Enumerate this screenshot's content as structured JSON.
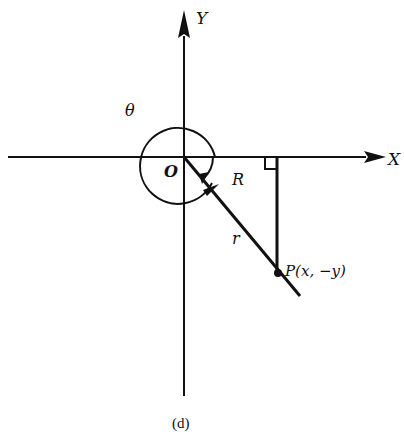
{
  "figure": {
    "caption": "(d)",
    "labels": {
      "y_axis": "Y",
      "x_axis": "X",
      "origin": "O",
      "angle_theta": "θ",
      "reference_angle": "R",
      "radius": "r",
      "point": "P(x, −y)"
    },
    "elements": [
      "x-axis with arrow",
      "y-axis with arrow",
      "terminal ray from O through P",
      "vertical perpendicular from P to x-axis",
      "right-angle marker",
      "theta arc (counterclockwise, >270°)",
      "reference angle R arc (clockwise)"
    ],
    "colors": {
      "ink": "#111111",
      "background": "#ffffff"
    }
  }
}
